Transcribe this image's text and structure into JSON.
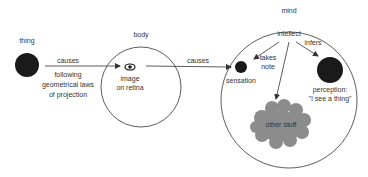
{
  "labels": {
    "thing": "thing",
    "body": "body",
    "mind": "mind",
    "causes1": "causes",
    "projection_line1": "following",
    "projection_line2": "geometrical laws",
    "projection_line3": "of projection",
    "image_line1": "image",
    "image_line2": "on retina",
    "causes2": "causes",
    "intellect": "intellect",
    "takes_line1": "takes",
    "takes_line2": "note",
    "infers": "infers",
    "sensation": "sensation",
    "perception_line1": "perception:",
    "perception_line2": "\"I see a thing\"",
    "other_stuff": "other stuff"
  },
  "colors": {
    "dot": "#1a1a1a",
    "line": "#333333",
    "cloud": "#8c8c8c",
    "text": "#333333"
  }
}
